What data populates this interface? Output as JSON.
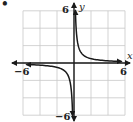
{
  "problem_marker": "•",
  "chart_data": {
    "type": "line",
    "title": "",
    "function": "y = 1/x",
    "xlabel": "x",
    "ylabel": "y",
    "xlim": [
      -6,
      6
    ],
    "ylim": [
      -6,
      6
    ],
    "grid": true,
    "grid_step": 2,
    "tick_labels": {
      "x": [
        "-6",
        "6"
      ],
      "y": [
        "6",
        "-6"
      ]
    },
    "series": [
      {
        "name": "branch-quadrant-I",
        "x": [
          0.17,
          0.25,
          0.5,
          1,
          2,
          3,
          4,
          5.5
        ],
        "y": [
          6,
          4,
          2,
          1,
          0.5,
          0.33,
          0.25,
          0.18
        ]
      },
      {
        "name": "branch-quadrant-III",
        "x": [
          -5.5,
          -4,
          -3,
          -2,
          -1,
          -0.5,
          -0.25,
          -0.17
        ],
        "y": [
          -0.18,
          -0.25,
          -0.33,
          -0.5,
          -1,
          -2,
          -4,
          -6
        ]
      }
    ],
    "colors": {
      "curve": "#1a1a1a",
      "axis": "#1a1a1a",
      "grid": "#c8c8c8"
    }
  },
  "labels": {
    "x_axis": "x",
    "y_axis": "y",
    "x_min": "−6",
    "x_max": "6",
    "y_max": "6",
    "y_min": "−6"
  }
}
